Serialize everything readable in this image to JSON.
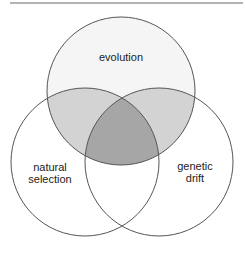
{
  "diagram": {
    "type": "venn-3",
    "top_rule": {
      "x1": 10,
      "x2": 243,
      "y": 3,
      "color": "#9a9a9a"
    },
    "stroke_color": "#555555",
    "colors": {
      "single_top": "#f5f5f5",
      "single_other": "#ffffff",
      "pair_overlap": "#d3d3d3",
      "triple_overlap": "#a6a6a6"
    },
    "sets": [
      {
        "id": "top",
        "label_lines": [
          "evolution"
        ],
        "cx": 121,
        "cy": 91,
        "r": 74
      },
      {
        "id": "left",
        "label_lines": [
          "natural",
          "selection"
        ],
        "cx": 85,
        "cy": 162,
        "r": 74
      },
      {
        "id": "right",
        "label_lines": [
          "genetic",
          "drift"
        ],
        "cx": 159,
        "cy": 162,
        "r": 74
      }
    ],
    "labels": {
      "top": {
        "line1": "evolution"
      },
      "left": {
        "line1": "natural",
        "line2": "selection"
      },
      "right": {
        "line1": "genetic",
        "line2": "drift"
      }
    }
  }
}
